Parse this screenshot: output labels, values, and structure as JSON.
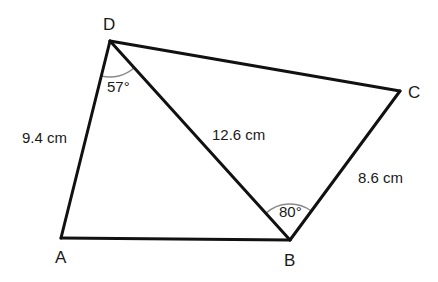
{
  "figure": {
    "type": "quadrilateral",
    "vertices": {
      "A": {
        "label": "A",
        "x": 61,
        "y": 238
      },
      "B": {
        "label": "B",
        "x": 290,
        "y": 240
      },
      "C": {
        "label": "C",
        "x": 400,
        "y": 91
      },
      "D": {
        "label": "D",
        "x": 110,
        "y": 41
      }
    },
    "edges": [
      {
        "from": "A",
        "to": "D",
        "length_label": "9.4 cm"
      },
      {
        "from": "D",
        "to": "C",
        "length_label": ""
      },
      {
        "from": "C",
        "to": "B",
        "length_label": "8.6 cm"
      },
      {
        "from": "B",
        "to": "A",
        "length_label": ""
      },
      {
        "from": "D",
        "to": "B",
        "length_label": "12.6 cm",
        "diagonal": true
      }
    ],
    "angles": [
      {
        "vertex": "D",
        "between": [
          "A",
          "B"
        ],
        "label": "57°"
      },
      {
        "vertex": "B",
        "between": [
          "D",
          "C"
        ],
        "label": "80°"
      }
    ]
  },
  "labels": {
    "vertex_a": "A",
    "vertex_b": "B",
    "vertex_c": "C",
    "vertex_d": "D",
    "side_ad": "9.4 cm",
    "side_cb": "8.6 cm",
    "diagonal_db": "12.6 cm",
    "angle_d": "57°",
    "angle_b": "80°"
  },
  "colors": {
    "line": "#111111",
    "arc": "#8a8a8a",
    "text": "#1a1a1a",
    "background": "#ffffff"
  }
}
